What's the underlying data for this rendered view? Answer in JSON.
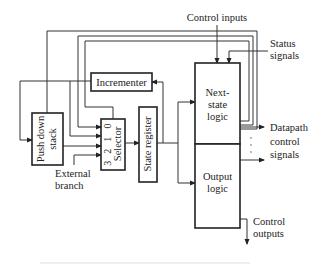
{
  "diagram": {
    "blocks": {
      "push_down_stack": "Push down stack",
      "push_down_stack_line1": "Push down",
      "push_down_stack_line2": "stack",
      "selector": "Selector",
      "selector_inputs": [
        "3",
        "2",
        "1",
        "0"
      ],
      "incrementer": "Incrementer",
      "state_register": "State register",
      "next_state_logic_line1": "Next-",
      "next_state_logic_line2": "state",
      "next_state_logic_line3": "logic",
      "output_logic_line1": "Output",
      "output_logic_line2": "logic"
    },
    "labels": {
      "control_inputs": "Control inputs",
      "status_signals_line1": "Status",
      "status_signals_line2": "signals",
      "external_branch_line1": "External",
      "external_branch_line2": "branch",
      "datapath_line1": "Datapath",
      "datapath_line2": "control",
      "datapath_line3": "signals",
      "control_outputs_line1": "Control",
      "control_outputs_line2": "outputs",
      "ellipsis": "·  ·  ·"
    }
  }
}
